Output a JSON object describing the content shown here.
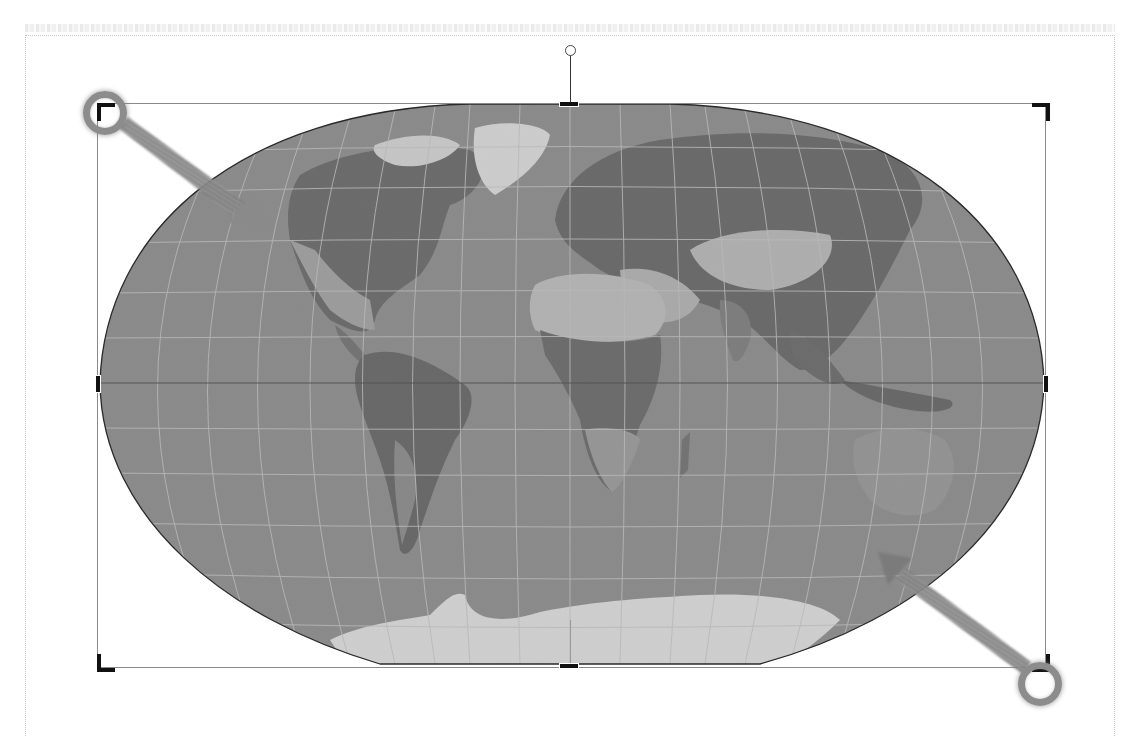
{
  "document": {
    "page_boundary": "dotted",
    "top_text_band": "faint"
  },
  "image": {
    "subject": "world-map",
    "projection": "pseudocylindrical (flat-polar)",
    "tone": "grayscale",
    "state": "crop-mode",
    "frame": {
      "x": 97,
      "y": 103,
      "width": 949,
      "height": 565
    }
  },
  "crop_handles": {
    "corners": [
      "top-left",
      "top-right",
      "bottom-left",
      "bottom-right"
    ],
    "edges": [
      "top",
      "bottom",
      "left",
      "right"
    ]
  },
  "rotate_handle": {
    "x": 570,
    "y": 50
  },
  "callouts": [
    {
      "id": "callout-top-left",
      "target": "top-left crop handle",
      "ring": {
        "x": 105,
        "y": 113
      }
    },
    {
      "id": "callout-bottom-right",
      "target": "bottom-right crop handle",
      "ring": {
        "x": 1040,
        "y": 684
      }
    }
  ],
  "colors": {
    "ocean": "#8e8e8e",
    "land_dark": "#5a5a5a",
    "land_light": "#c8c8c8",
    "ice": "#f4f4f4",
    "graticule": "#d8d8d8",
    "callout": "#8c8c8c",
    "handle": "#111111"
  }
}
